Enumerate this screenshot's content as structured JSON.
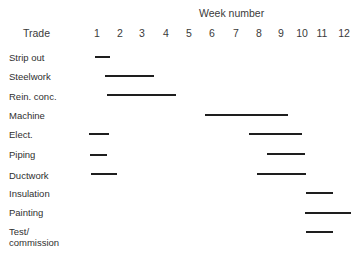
{
  "header": {
    "trade_label": "Trade",
    "week_title": "Week number"
  },
  "chart_data": {
    "type": "gantt",
    "title": "",
    "xlabel": "Week number",
    "ylabel": "Trade",
    "x_ticks": [
      "1",
      "2",
      "3",
      "4",
      "5",
      "6",
      "7",
      "8",
      "9",
      "10",
      "11",
      "12"
    ],
    "xlim": [
      0.5,
      12.5
    ],
    "grid": false,
    "legend": null,
    "rows": [
      {
        "label": "Strip out",
        "bars": [
          {
            "start": 1.0,
            "end": 1.6
          }
        ]
      },
      {
        "label": "Steelwork",
        "bars": [
          {
            "start": 1.4,
            "end": 3.5
          }
        ]
      },
      {
        "label": "Rein. conc.",
        "bars": [
          {
            "start": 1.4,
            "end": 4.4
          }
        ]
      },
      {
        "label": "Machine",
        "bars": [
          {
            "start": 5.7,
            "end": 9.3
          }
        ]
      },
      {
        "label": "Elect.",
        "bars": [
          {
            "start": 0.7,
            "end": 1.5
          },
          {
            "start": 7.6,
            "end": 10.0
          }
        ]
      },
      {
        "label": "Piping",
        "bars": [
          {
            "start": 0.7,
            "end": 1.4
          },
          {
            "start": 8.4,
            "end": 10.1
          }
        ]
      },
      {
        "label": "Ductwork",
        "bars": [
          {
            "start": 0.7,
            "end": 1.9
          },
          {
            "start": 7.9,
            "end": 10.2
          }
        ]
      },
      {
        "label": "Insulation",
        "bars": [
          {
            "start": 10.2,
            "end": 11.5
          }
        ]
      },
      {
        "label": "Painting",
        "bars": [
          {
            "start": 10.1,
            "end": 12.3
          }
        ]
      },
      {
        "label": "Test/\ncommission",
        "bars": [
          {
            "start": 10.2,
            "end": 11.5
          }
        ]
      }
    ]
  },
  "layout": {
    "tick_x": [
      97,
      120,
      142,
      166,
      189,
      212,
      236,
      259,
      281,
      302,
      322,
      344
    ],
    "rows": [
      {
        "label_y": 52,
        "bars": [
          {
            "x1": 95,
            "x2": 110,
            "y": 57
          }
        ]
      },
      {
        "label_y": 71,
        "bars": [
          {
            "x1": 105,
            "x2": 154,
            "y": 76
          }
        ]
      },
      {
        "label_y": 91,
        "bars": [
          {
            "x1": 107,
            "x2": 176,
            "y": 95
          }
        ]
      },
      {
        "label_y": 110,
        "bars": [
          {
            "x1": 205,
            "x2": 288,
            "y": 115
          }
        ]
      },
      {
        "label_y": 129,
        "bars": [
          {
            "x1": 89,
            "x2": 109,
            "y": 134
          },
          {
            "x1": 249,
            "x2": 302,
            "y": 134
          }
        ]
      },
      {
        "label_y": 149,
        "bars": [
          {
            "x1": 90,
            "x2": 107,
            "y": 155
          },
          {
            "x1": 267,
            "x2": 305,
            "y": 154
          }
        ]
      },
      {
        "label_y": 170,
        "bars": [
          {
            "x1": 91,
            "x2": 117,
            "y": 174
          },
          {
            "x1": 257,
            "x2": 306,
            "y": 174
          }
        ]
      },
      {
        "label_y": 188,
        "bars": [
          {
            "x1": 306,
            "x2": 333,
            "y": 193
          }
        ]
      },
      {
        "label_y": 207,
        "bars": [
          {
            "x1": 305,
            "x2": 351,
            "y": 213
          }
        ]
      },
      {
        "label_y": 226,
        "bars": [
          {
            "x1": 306,
            "x2": 333,
            "y": 232
          }
        ]
      }
    ]
  }
}
